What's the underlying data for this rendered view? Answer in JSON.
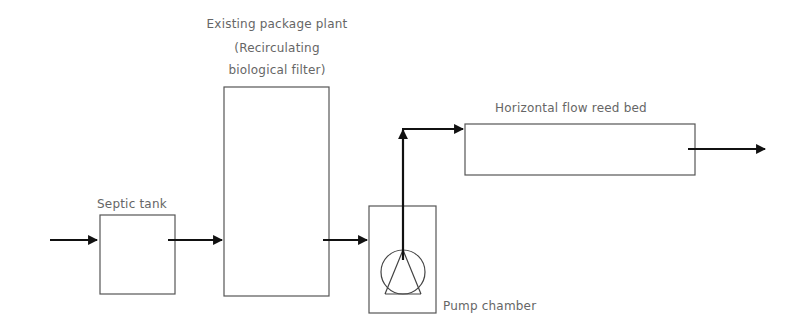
{
  "diagram": {
    "nodes": [
      {
        "id": "septic_tank",
        "label": "Septic tank"
      },
      {
        "id": "package_plant",
        "label_line1": "Existing package plant",
        "label_line2": "(Recirculating",
        "label_line3": "biological filter)"
      },
      {
        "id": "pump_chamber",
        "label": "Pump chamber"
      },
      {
        "id": "reed_bed",
        "label": "Horizontal flow reed bed"
      }
    ],
    "edges": [
      {
        "from": "inlet",
        "to": "septic_tank"
      },
      {
        "from": "septic_tank",
        "to": "package_plant"
      },
      {
        "from": "package_plant",
        "to": "pump_chamber"
      },
      {
        "from": "pump_chamber",
        "to": "reed_bed"
      },
      {
        "from": "reed_bed",
        "to": "outlet"
      }
    ],
    "colors": {
      "box_stroke": "#555555",
      "arrow": "#111111",
      "label": "#666666"
    }
  }
}
